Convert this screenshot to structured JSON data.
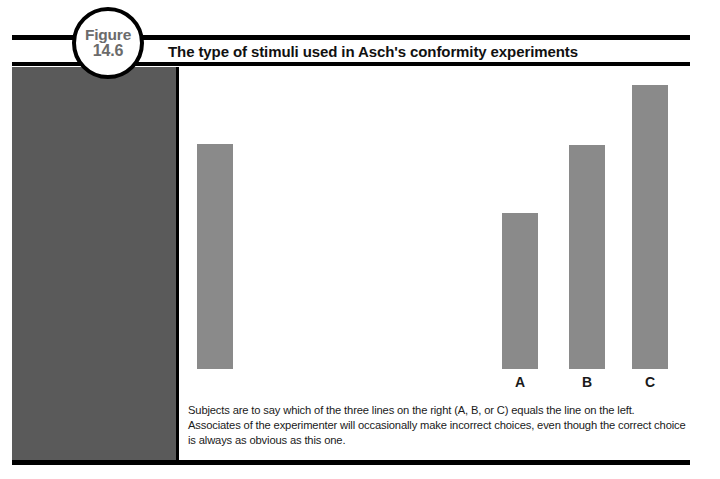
{
  "figure": {
    "badge_word": "Figure",
    "badge_number": "14.6",
    "title": "The type of stimuli used in Asch's conformity experiments",
    "caption": "Subjects are to say which of the three lines on the right (A, B, or C) equals the line on the left. Associates of the experimenter will occasionally make incorrect choices, even though the correct choice is always as obvious as this one."
  },
  "colors": {
    "panel_dark": "#5a5a5a",
    "bar_gray": "#8a8a8a",
    "rule_black": "#000000",
    "badge_text": "#6b6b6b",
    "background": "#ffffff"
  },
  "chart_data": {
    "type": "bar",
    "title": "The type of stimuli used in Asch's conformity experiments",
    "xlabel": "",
    "ylabel": "",
    "grid": false,
    "legend": "none",
    "baseline_y_px": 369,
    "categories": [
      "Reference",
      "A",
      "B",
      "C"
    ],
    "values": [
      225,
      156,
      224,
      284
    ],
    "bars": [
      {
        "id": "reference",
        "label": "",
        "group": "standard-line",
        "x_px": 197,
        "top_px": 144,
        "width_px": 36,
        "height_px": 225,
        "color": "#8a8a8a"
      },
      {
        "id": "a",
        "label": "A",
        "group": "comparison-lines",
        "x_px": 502,
        "top_px": 213,
        "width_px": 36,
        "height_px": 156,
        "color": "#8a8a8a"
      },
      {
        "id": "b",
        "label": "B",
        "group": "comparison-lines",
        "x_px": 569,
        "top_px": 145,
        "width_px": 36,
        "height_px": 224,
        "color": "#8a8a8a"
      },
      {
        "id": "c",
        "label": "C",
        "group": "comparison-lines",
        "x_px": 632,
        "top_px": 85,
        "width_px": 36,
        "height_px": 284,
        "color": "#8a8a8a"
      }
    ],
    "labels": [
      "A",
      "B",
      "C"
    ],
    "label_y_px": 374
  }
}
